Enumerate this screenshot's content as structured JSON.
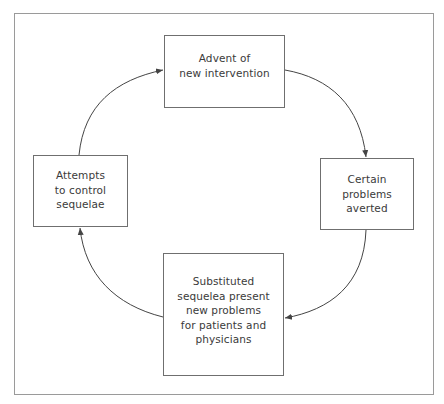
{
  "diagram": {
    "type": "cycle",
    "nodes": [
      {
        "id": "top",
        "label": "Advent of\nnew intervention"
      },
      {
        "id": "right",
        "label": "Certain\nproblems\naverted"
      },
      {
        "id": "bottom",
        "label": "Substituted\nsequelea present\nnew problems\nfor patients and\nphysicians"
      },
      {
        "id": "left",
        "label": "Attempts\nto control\nsequelae"
      }
    ],
    "edges": [
      {
        "from": "top",
        "to": "right"
      },
      {
        "from": "right",
        "to": "bottom"
      },
      {
        "from": "bottom",
        "to": "left"
      },
      {
        "from": "left",
        "to": "top"
      }
    ]
  },
  "colors": {
    "frame": "#9a9a9a",
    "box_border": "#6f6f6f",
    "arrow": "#444444",
    "text": "#3a3a3a",
    "background": "#ffffff"
  }
}
